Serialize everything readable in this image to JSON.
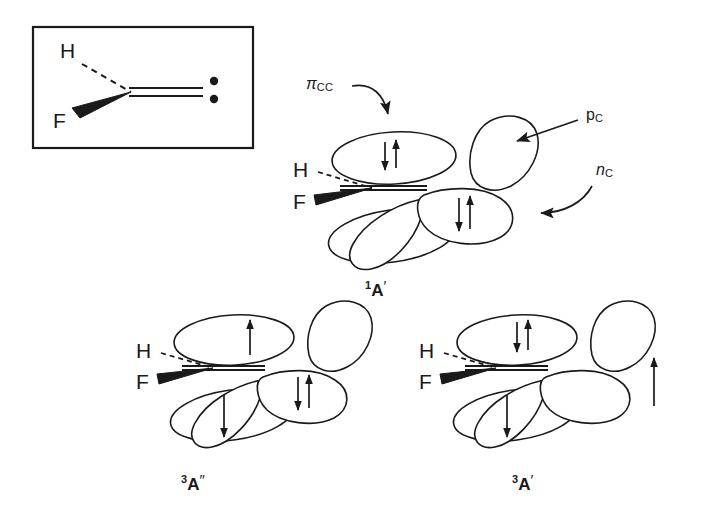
{
  "figure": {
    "inset": {
      "name": "lewis-structure-inset",
      "atoms": {
        "h": "H",
        "f": "F"
      },
      "lone_pair_dots": 2,
      "bond_types": {
        "h_bond": "dashed",
        "f_bond": "wedge",
        "cc_bond": "double"
      }
    },
    "orbital_labels": [
      {
        "id": "pi-cc",
        "base": "π",
        "sub": "CC",
        "italic": true,
        "pointer": "curved-arrow-down"
      },
      {
        "id": "p-c",
        "base": "p",
        "sub": "C",
        "italic": false,
        "pointer": "straight-arrow-left"
      },
      {
        "id": "n-c",
        "base": "n",
        "sub": "C",
        "italic": true,
        "pointer": "curved-arrow-left"
      }
    ],
    "structures": [
      {
        "id": "singlet-a-prime",
        "name": "state-1A-prime",
        "multiplicity": "1",
        "term": "A",
        "prime": "′",
        "atoms": {
          "h": "H",
          "f": "F"
        },
        "occupancy": {
          "pi_cc": "up-down",
          "p_c": "empty",
          "n_c": "up-down",
          "pi_star": "empty"
        },
        "electrons": 4
      },
      {
        "id": "triplet-a-double-prime",
        "name": "state-3A-double-prime",
        "multiplicity": "3",
        "term": "A",
        "prime": "″",
        "atoms": {
          "h": "H",
          "f": "F"
        },
        "occupancy": {
          "pi_cc": "up",
          "p_c": "empty",
          "n_c": "up-down",
          "pi_star": "down"
        },
        "electrons": 4
      },
      {
        "id": "triplet-a-prime",
        "name": "state-3A-prime",
        "multiplicity": "3",
        "term": "A",
        "prime": "′",
        "atoms": {
          "h": "H",
          "f": "F"
        },
        "occupancy": {
          "pi_cc": "up-down",
          "p_c": "empty",
          "n_c": "up",
          "pi_star": "down"
        },
        "electrons": 4
      }
    ],
    "colors": {
      "ink": "#1a1a1a",
      "background": "#ffffff",
      "fill": "#ffffff"
    }
  }
}
